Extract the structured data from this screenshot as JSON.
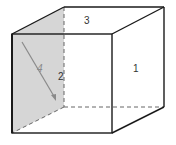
{
  "diagram": {
    "type": "cube-faces",
    "faces": [
      {
        "id": "face-1",
        "label": "1",
        "position": "right side face"
      },
      {
        "id": "face-2",
        "label": "2",
        "position": "back left edge face (hidden)"
      },
      {
        "id": "face-3",
        "label": "3",
        "position": "top face"
      },
      {
        "id": "face-4",
        "label": "4",
        "position": "left side face (shaded)"
      }
    ],
    "colors": {
      "edge": "#1a1a1a",
      "hidden_edge": "#666666",
      "shaded_face": "#d6d6d6",
      "arrow": "#8a8a8a",
      "background": "#ffffff"
    },
    "arrow": {
      "from": [
        22,
        42
      ],
      "to": [
        56,
        100
      ]
    }
  }
}
